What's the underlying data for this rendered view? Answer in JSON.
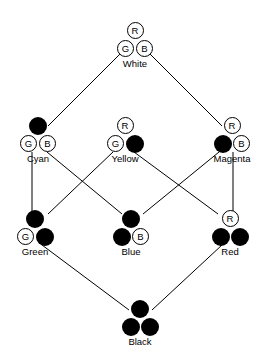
{
  "diagram": {
    "type": "hasse-diagram",
    "canvas": {
      "width": 269,
      "height": 359
    },
    "colors": {
      "stroke": "#000000",
      "fill_present": "#000000",
      "fill_absent": "#ffffff",
      "background": "#ffffff",
      "text": "#000000"
    },
    "channel_labels": {
      "red": "R",
      "green": "G",
      "blue": "B"
    },
    "nodes": [
      {
        "id": "white",
        "label": "White",
        "x": 135,
        "y": 44,
        "beads": [
          {
            "slot": "top",
            "channel": "R",
            "glyph": "R",
            "state": "open"
          },
          {
            "slot": "left",
            "channel": "G",
            "glyph": "G",
            "state": "open"
          },
          {
            "slot": "right",
            "channel": "B",
            "glyph": "B",
            "state": "open"
          }
        ]
      },
      {
        "id": "cyan",
        "label": "Cyan",
        "x": 38,
        "y": 139,
        "beads": [
          {
            "slot": "top",
            "channel": "R",
            "glyph": "R",
            "state": "filled"
          },
          {
            "slot": "left",
            "channel": "G",
            "glyph": "G",
            "state": "open"
          },
          {
            "slot": "right",
            "channel": "B",
            "glyph": "B",
            "state": "open"
          }
        ]
      },
      {
        "id": "yellow",
        "label": "Yellow",
        "x": 125,
        "y": 139,
        "beads": [
          {
            "slot": "top",
            "channel": "R",
            "glyph": "R",
            "state": "open"
          },
          {
            "slot": "left",
            "channel": "G",
            "glyph": "G",
            "state": "open"
          },
          {
            "slot": "right",
            "channel": "B",
            "glyph": "B",
            "state": "filled"
          }
        ]
      },
      {
        "id": "magenta",
        "label": "Magenta",
        "x": 232,
        "y": 139,
        "beads": [
          {
            "slot": "top",
            "channel": "R",
            "glyph": "R",
            "state": "open"
          },
          {
            "slot": "left",
            "channel": "G",
            "glyph": "G",
            "state": "filled"
          },
          {
            "slot": "right",
            "channel": "B",
            "glyph": "B",
            "state": "open"
          }
        ]
      },
      {
        "id": "green",
        "label": "Green",
        "x": 35,
        "y": 232,
        "beads": [
          {
            "slot": "top",
            "channel": "R",
            "glyph": "R",
            "state": "filled"
          },
          {
            "slot": "left",
            "channel": "G",
            "glyph": "G",
            "state": "open"
          },
          {
            "slot": "right",
            "channel": "B",
            "glyph": "B",
            "state": "filled"
          }
        ]
      },
      {
        "id": "blue",
        "label": "Blue",
        "x": 131,
        "y": 232,
        "beads": [
          {
            "slot": "top",
            "channel": "R",
            "glyph": "R",
            "state": "filled"
          },
          {
            "slot": "left",
            "channel": "G",
            "glyph": "G",
            "state": "filled"
          },
          {
            "slot": "right",
            "channel": "B",
            "glyph": "B",
            "state": "open"
          }
        ]
      },
      {
        "id": "red",
        "label": "Red",
        "x": 230,
        "y": 232,
        "beads": [
          {
            "slot": "top",
            "channel": "R",
            "glyph": "R",
            "state": "open"
          },
          {
            "slot": "left",
            "channel": "G",
            "glyph": "G",
            "state": "filled"
          },
          {
            "slot": "right",
            "channel": "B",
            "glyph": "B",
            "state": "filled"
          }
        ]
      },
      {
        "id": "black",
        "label": "Black",
        "x": 140,
        "y": 322,
        "beads": [
          {
            "slot": "top",
            "channel": "R",
            "glyph": "R",
            "state": "filled"
          },
          {
            "slot": "left",
            "channel": "G",
            "glyph": "G",
            "state": "filled"
          },
          {
            "slot": "right",
            "channel": "B",
            "glyph": "B",
            "state": "filled"
          }
        ]
      }
    ],
    "edges": [
      {
        "from": "white",
        "to": "cyan",
        "x1": 124,
        "y1": 50,
        "x2": 48,
        "y2": 126
      },
      {
        "from": "white",
        "to": "magenta",
        "x1": 146,
        "y1": 50,
        "x2": 222,
        "y2": 126
      },
      {
        "from": "cyan",
        "to": "green",
        "x1": 32,
        "y1": 152,
        "x2": 32,
        "y2": 214
      },
      {
        "from": "cyan",
        "to": "blue",
        "x1": 47,
        "y1": 152,
        "x2": 122,
        "y2": 214
      },
      {
        "from": "yellow",
        "to": "green",
        "x1": 113,
        "y1": 152,
        "x2": 48,
        "y2": 214
      },
      {
        "from": "yellow",
        "to": "red",
        "x1": 134,
        "y1": 152,
        "x2": 218,
        "y2": 214
      },
      {
        "from": "magenta",
        "to": "blue",
        "x1": 219,
        "y1": 152,
        "x2": 143,
        "y2": 214
      },
      {
        "from": "magenta",
        "to": "red",
        "x1": 233,
        "y1": 152,
        "x2": 233,
        "y2": 214
      },
      {
        "from": "green",
        "to": "black",
        "x1": 42,
        "y1": 245,
        "x2": 129,
        "y2": 310
      },
      {
        "from": "red",
        "to": "black",
        "x1": 222,
        "y1": 245,
        "x2": 152,
        "y2": 310
      }
    ]
  }
}
